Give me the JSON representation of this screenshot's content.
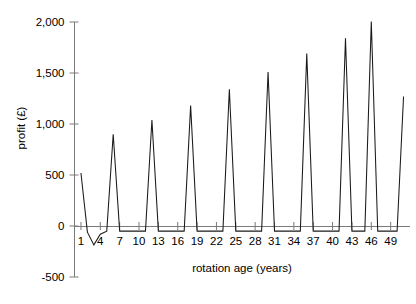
{
  "chart_data": {
    "type": "line",
    "title": "",
    "xlabel": "rotation age (years)",
    "ylabel": "profit (£)",
    "xlim": [
      0,
      52
    ],
    "ylim": [
      -500,
      2000
    ],
    "grid": false,
    "legend": "none",
    "y_ticks": [
      {
        "value": 2000,
        "label": "2,000"
      },
      {
        "value": 1500,
        "label": "1,500"
      },
      {
        "value": 1000,
        "label": "1,000"
      },
      {
        "value": 500,
        "label": "500"
      },
      {
        "value": 0,
        "label": "0"
      },
      {
        "value": -500,
        "label": "-500"
      }
    ],
    "x_ticks": [
      {
        "value": 1,
        "label": "1"
      },
      {
        "value": 4,
        "label": "4"
      },
      {
        "value": 7,
        "label": "7"
      },
      {
        "value": 10,
        "label": "10"
      },
      {
        "value": 13,
        "label": "13"
      },
      {
        "value": 16,
        "label": "16"
      },
      {
        "value": 19,
        "label": "19"
      },
      {
        "value": 22,
        "label": "22"
      },
      {
        "value": 25,
        "label": "25"
      },
      {
        "value": 28,
        "label": "28"
      },
      {
        "value": 31,
        "label": "31"
      },
      {
        "value": 34,
        "label": "34"
      },
      {
        "value": 37,
        "label": "37"
      },
      {
        "value": 40,
        "label": "40"
      },
      {
        "value": 43,
        "label": "43"
      },
      {
        "value": 46,
        "label": "46"
      },
      {
        "value": 49,
        "label": "49"
      }
    ],
    "series": [
      {
        "name": "profit",
        "x": [
          1,
          2,
          3,
          4,
          5,
          6,
          7,
          8,
          9,
          10,
          11,
          12,
          13,
          14,
          15,
          16,
          17,
          18,
          19,
          20,
          21,
          22,
          23,
          24,
          25,
          26,
          27,
          28,
          29,
          30,
          31,
          32,
          33,
          34,
          35,
          36,
          37,
          38,
          39,
          40,
          41,
          42,
          43,
          44,
          45,
          46,
          47,
          48,
          49,
          50,
          51
        ],
        "values": [
          520,
          -60,
          -185,
          -80,
          -50,
          900,
          -50,
          -50,
          -50,
          -50,
          -50,
          1040,
          -50,
          -50,
          -50,
          -50,
          -50,
          1180,
          -50,
          -50,
          -50,
          -50,
          -50,
          1340,
          -50,
          -50,
          -50,
          -50,
          -50,
          1510,
          -50,
          -50,
          -50,
          -50,
          -50,
          1690,
          -50,
          -50,
          -50,
          -50,
          -50,
          1840,
          -50,
          -50,
          -50,
          2005,
          -50,
          -50,
          -50,
          -50,
          1270
        ]
      }
    ],
    "peaks": [
      {
        "x": 6,
        "y": 900
      },
      {
        "x": 12,
        "y": 1040
      },
      {
        "x": 18,
        "y": 1180
      },
      {
        "x": 24,
        "y": 1340
      },
      {
        "x": 30,
        "y": 1510
      },
      {
        "x": 36,
        "y": 1690
      },
      {
        "x": 42,
        "y": 1840
      },
      {
        "x": 46,
        "y": 2005
      }
    ],
    "baseline_value": -50
  }
}
